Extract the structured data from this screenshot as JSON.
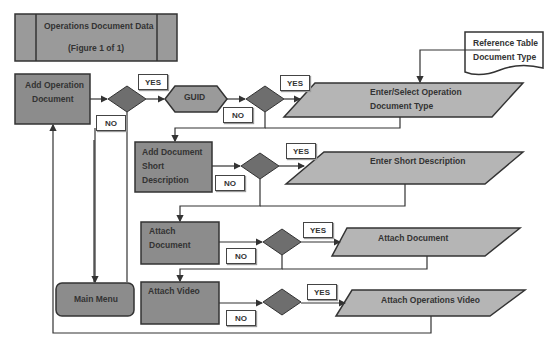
{
  "title": {
    "line1": "Operations Document Data",
    "line2": "(Figure 1 of 1)"
  },
  "nodes": {
    "add_operation_document": {
      "line1": "Add Operation",
      "line2": "Document"
    },
    "guid": "GUID",
    "enter_select": {
      "line1": "Enter/Select Operation",
      "line2": "Document Type"
    },
    "reference_table": {
      "line1": "Reference Table",
      "line2": "Document Type"
    },
    "add_short_description": {
      "line1": "Add Document",
      "line2": "Short",
      "line3": "Description"
    },
    "enter_short_description": "Enter Short Description",
    "attach_document_process": {
      "line1": "Attach",
      "line2": "Document"
    },
    "attach_document_io": "Attach Document",
    "main_menu": "Main Menu",
    "attach_video_process": "Attach Video",
    "attach_video_io": "Attach Operations Video"
  },
  "labels": {
    "yes": "YES",
    "no": "NO"
  },
  "colors": {
    "process": "#8c8c8c",
    "io": "#b5b5b5",
    "decision": "#6e6e6e",
    "line": "#333333"
  }
}
